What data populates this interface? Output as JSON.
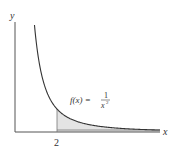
{
  "chart_data": {
    "type": "area",
    "title": "",
    "function_label": "f(x) = 1/x^2",
    "function_label_parts": {
      "lhs": "f(x) =",
      "num": "1",
      "den": "x",
      "exp": "2"
    },
    "xlabel": "x",
    "ylabel": "y",
    "x_ticks": [
      {
        "value": 2,
        "label": "2"
      }
    ],
    "y_ticks": [],
    "shaded_region": {
      "from": 2,
      "to": "infinity",
      "description": "area under f(x)=1/x^2 for x >= 2"
    },
    "grid": false,
    "legend": null,
    "colors": {
      "curve": "#333333",
      "axis": "#444444",
      "shade": "#e6e6e6"
    }
  },
  "axes": {
    "x_label": "x",
    "y_label": "y",
    "tick_2": "2"
  },
  "annotation": {
    "lhs": "f(x) =",
    "num": "1",
    "den": "x",
    "exp": "2"
  }
}
